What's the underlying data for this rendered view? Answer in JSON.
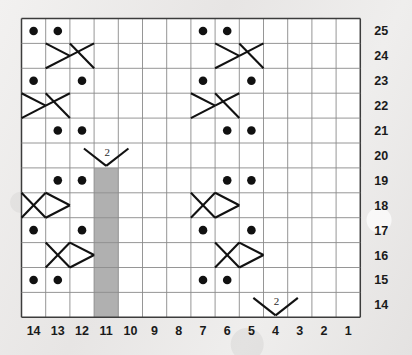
{
  "chart_data": {
    "type": "table",
    "title": "",
    "subtitle": "",
    "xlabel": "",
    "ylabel": "",
    "grid": true,
    "legend_position": "none",
    "columns": 14,
    "rows": 12,
    "column_labels": [
      "14",
      "13",
      "12",
      "11",
      "10",
      "9",
      "8",
      "7",
      "6",
      "5",
      "4",
      "3",
      "2",
      "1"
    ],
    "row_labels": [
      "25",
      "24",
      "23",
      "22",
      "21",
      "20",
      "19",
      "18",
      "17",
      "16",
      "15",
      "14"
    ],
    "column_label_order": "right-to-left",
    "row_label_order": "top-to-bottom-descending",
    "symbol_legend": {
      "dot": "purl stitch",
      "cable-right": "cable cross right",
      "cable-left": "cable cross left",
      "no-stitch": "no stitch (grey block)",
      "v-two": "decrease worked over 2 stitches"
    },
    "colors": {
      "grid_line": "#8a8a8a",
      "grid_border": "#3c3c3c",
      "cell_fill": "#ffffff",
      "symbol": "#111111",
      "no_stitch_fill": "#b0b0b0",
      "background": "#eceaea",
      "label_text": "#1a1a1a"
    },
    "cells": [
      {
        "row": "25",
        "col": "14",
        "symbol": "dot"
      },
      {
        "row": "25",
        "col": "13",
        "symbol": "dot"
      },
      {
        "row": "25",
        "col": "7",
        "symbol": "dot"
      },
      {
        "row": "25",
        "col": "6",
        "symbol": "dot"
      },
      {
        "row": "24",
        "col": "13",
        "symbol": "cable-right-start"
      },
      {
        "row": "24",
        "col": "12",
        "symbol": "cable-right-end"
      },
      {
        "row": "24",
        "col": "6",
        "symbol": "cable-right-start"
      },
      {
        "row": "24",
        "col": "5",
        "symbol": "cable-right-end"
      },
      {
        "row": "23",
        "col": "14",
        "symbol": "dot"
      },
      {
        "row": "23",
        "col": "12",
        "symbol": "dot"
      },
      {
        "row": "23",
        "col": "7",
        "symbol": "dot"
      },
      {
        "row": "23",
        "col": "5",
        "symbol": "dot"
      },
      {
        "row": "22",
        "col": "14",
        "symbol": "cable-right-start"
      },
      {
        "row": "22",
        "col": "13",
        "symbol": "cable-right-end"
      },
      {
        "row": "22",
        "col": "7",
        "symbol": "cable-right-start"
      },
      {
        "row": "22",
        "col": "6",
        "symbol": "cable-right-end"
      },
      {
        "row": "21",
        "col": "13",
        "symbol": "dot"
      },
      {
        "row": "21",
        "col": "12",
        "symbol": "dot"
      },
      {
        "row": "21",
        "col": "6",
        "symbol": "dot"
      },
      {
        "row": "21",
        "col": "5",
        "symbol": "dot"
      },
      {
        "row": "20",
        "col": "11",
        "symbol": "v-two",
        "label": "2"
      },
      {
        "row": "19",
        "col": "13",
        "symbol": "dot"
      },
      {
        "row": "19",
        "col": "12",
        "symbol": "dot"
      },
      {
        "row": "19",
        "col": "6",
        "symbol": "dot"
      },
      {
        "row": "19",
        "col": "5",
        "symbol": "dot"
      },
      {
        "row": "19",
        "col": "11",
        "symbol": "no-stitch"
      },
      {
        "row": "18",
        "col": "14",
        "symbol": "cable-left-start"
      },
      {
        "row": "18",
        "col": "13",
        "symbol": "cable-left-end"
      },
      {
        "row": "18",
        "col": "7",
        "symbol": "cable-left-start"
      },
      {
        "row": "18",
        "col": "6",
        "symbol": "cable-left-end"
      },
      {
        "row": "18",
        "col": "11",
        "symbol": "no-stitch"
      },
      {
        "row": "17",
        "col": "14",
        "symbol": "dot"
      },
      {
        "row": "17",
        "col": "12",
        "symbol": "dot"
      },
      {
        "row": "17",
        "col": "7",
        "symbol": "dot"
      },
      {
        "row": "17",
        "col": "5",
        "symbol": "dot"
      },
      {
        "row": "17",
        "col": "11",
        "symbol": "no-stitch"
      },
      {
        "row": "16",
        "col": "13",
        "symbol": "cable-left-start"
      },
      {
        "row": "16",
        "col": "12",
        "symbol": "cable-left-end"
      },
      {
        "row": "16",
        "col": "6",
        "symbol": "cable-left-start"
      },
      {
        "row": "16",
        "col": "5",
        "symbol": "cable-left-end"
      },
      {
        "row": "16",
        "col": "11",
        "symbol": "no-stitch"
      },
      {
        "row": "15",
        "col": "14",
        "symbol": "dot"
      },
      {
        "row": "15",
        "col": "13",
        "symbol": "dot"
      },
      {
        "row": "15",
        "col": "7",
        "symbol": "dot"
      },
      {
        "row": "15",
        "col": "6",
        "symbol": "dot"
      },
      {
        "row": "15",
        "col": "11",
        "symbol": "no-stitch"
      },
      {
        "row": "14",
        "col": "4",
        "symbol": "v-two",
        "label": "2"
      },
      {
        "row": "14",
        "col": "11",
        "symbol": "no-stitch"
      }
    ],
    "annotations": [
      {
        "text": "2",
        "row": "20",
        "col": "11"
      },
      {
        "text": "2",
        "row": "14",
        "col": "4"
      }
    ]
  }
}
